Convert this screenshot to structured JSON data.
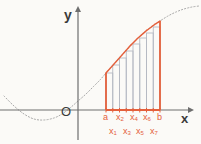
{
  "figure": {
    "background_color": "#fbfaf7"
  },
  "colors": {
    "accent": "#e4603c",
    "axis": "#6e6e6e",
    "curve_dotted": "#a8a8a8",
    "rectangle_stroke": "#b6bac3",
    "text": "#3a3a3a"
  },
  "axes": {
    "y_label": "y",
    "x_label": "x",
    "origin_label": "O",
    "x_axis_y": 110,
    "y_axis_x": 78,
    "x_arrow_end": 194,
    "y_arrow_end": 6
  },
  "interval": {
    "start_label": "a",
    "end_label": "b",
    "start_px": 106,
    "end_px": 160,
    "subdivisions": 8
  },
  "tick_labels": {
    "top_row": [
      {
        "id": "a",
        "base": "a",
        "sub": "",
        "x": 103
      },
      {
        "id": "x2",
        "base": "x",
        "sub": "2",
        "x": 116
      },
      {
        "id": "x4",
        "base": "x",
        "sub": "4",
        "x": 130
      },
      {
        "id": "x6",
        "base": "x",
        "sub": "6",
        "x": 143
      },
      {
        "id": "b",
        "base": "b",
        "sub": "",
        "x": 157
      }
    ],
    "bottom_row": [
      {
        "id": "x1",
        "base": "x",
        "sub": "1",
        "x": 109
      },
      {
        "id": "x3",
        "base": "x",
        "sub": "3",
        "x": 123
      },
      {
        "id": "x5",
        "base": "x",
        "sub": "5",
        "x": 136
      },
      {
        "id": "x7",
        "base": "x",
        "sub": "7",
        "x": 150
      }
    ]
  },
  "chart_data": {
    "type": "area",
    "xlabel": "x",
    "ylabel": "y",
    "grid": false,
    "legend": null,
    "curve_description": "Increasing S-shaped (cubic-like) curve; dips below the x-axis at the left, crosses near the origin, rises steeply through the interval [a, b] and flattens beyond b.",
    "curve_points": [
      [
        4,
        96
      ],
      [
        14,
        106
      ],
      [
        24,
        114
      ],
      [
        34,
        119
      ],
      [
        44,
        120
      ],
      [
        54,
        118
      ],
      [
        62,
        114
      ],
      [
        70,
        108
      ],
      [
        78,
        101
      ],
      [
        86,
        94
      ],
      [
        94,
        86
      ],
      [
        100,
        80
      ],
      [
        106,
        73
      ],
      [
        114,
        64
      ],
      [
        122,
        55
      ],
      [
        130,
        46
      ],
      [
        138,
        38
      ],
      [
        146,
        31
      ],
      [
        154,
        25
      ],
      [
        160,
        21
      ],
      [
        168,
        16
      ],
      [
        176,
        12
      ],
      [
        184,
        9
      ],
      [
        192,
        7
      ],
      [
        199,
        6
      ]
    ],
    "solid_segment_range": [
      106,
      160
    ],
    "rectangles": [
      {
        "index": 1,
        "left_label": "a",
        "right_label": "x1",
        "x_left": 106.0,
        "x_right": 112.75,
        "top_y": 73
      },
      {
        "index": 2,
        "left_label": "x1",
        "right_label": "x2",
        "x_left": 112.75,
        "x_right": 119.5,
        "top_y": 65
      },
      {
        "index": 3,
        "left_label": "x2",
        "right_label": "x3",
        "x_left": 119.5,
        "x_right": 126.25,
        "top_y": 58
      },
      {
        "index": 4,
        "left_label": "x3",
        "right_label": "x4",
        "x_left": 126.25,
        "x_right": 133.0,
        "top_y": 51
      },
      {
        "index": 5,
        "left_label": "x4",
        "right_label": "x5",
        "x_left": 133.0,
        "x_right": 139.75,
        "top_y": 44
      },
      {
        "index": 6,
        "left_label": "x5",
        "right_label": "x6",
        "x_left": 139.75,
        "x_right": 146.5,
        "top_y": 38
      },
      {
        "index": 7,
        "left_label": "x6",
        "right_label": "x7",
        "x_left": 146.5,
        "x_right": 153.25,
        "top_y": 33
      },
      {
        "index": 8,
        "left_label": "x7",
        "right_label": "b",
        "x_left": 153.25,
        "x_right": 160.0,
        "top_y": 27
      }
    ],
    "baseline_y": 110
  }
}
